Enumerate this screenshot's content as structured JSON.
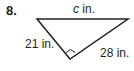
{
  "problem": {
    "number": "8.",
    "hypotenuse_var": "c",
    "hypotenuse_unit": " in.",
    "leg_left": "21 in.",
    "leg_right": "28 in."
  },
  "colors": {
    "stroke": "#231f20",
    "background": "#ffffff"
  }
}
